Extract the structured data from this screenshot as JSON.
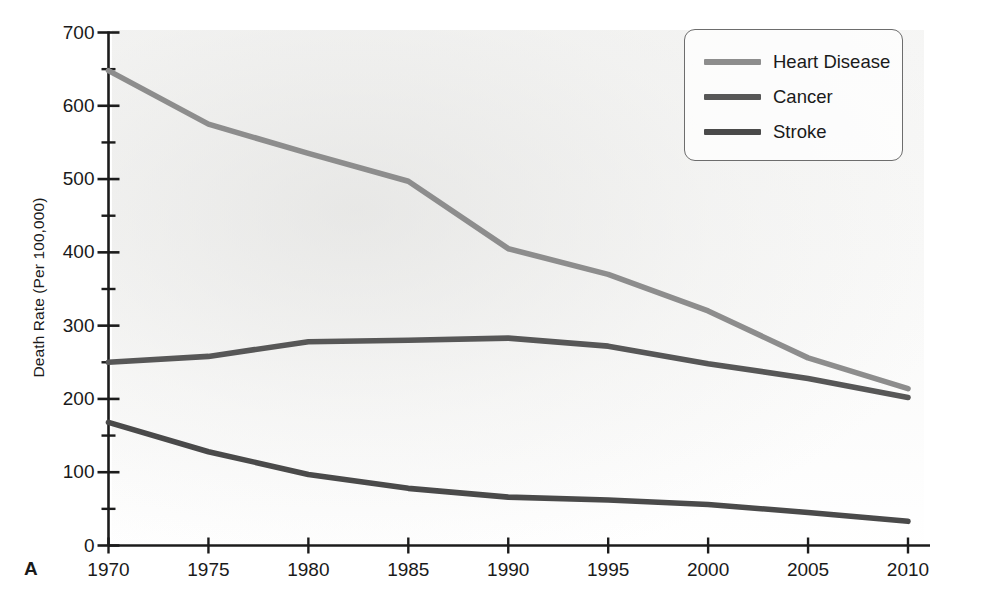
{
  "panel": {
    "letter": "A"
  },
  "legend": {
    "position": "top-right",
    "entries": [
      {
        "label": "Heart Disease",
        "color": "#8d8d8d"
      },
      {
        "label": "Cancer",
        "color": "#575757"
      },
      {
        "label": "Stroke",
        "color": "#4a4a4a"
      }
    ]
  },
  "axes": {
    "y_title": "Death Rate (Per 100,000)",
    "x_title": "",
    "y_ticks": [
      "0",
      "100",
      "200",
      "300",
      "400",
      "500",
      "600",
      "700"
    ],
    "x_ticks": [
      "1970",
      "1975",
      "1980",
      "1985",
      "1990",
      "1995",
      "2000",
      "2005",
      "2010"
    ]
  },
  "chart_data": {
    "type": "line",
    "title": "",
    "subtitle": "",
    "xlabel": "",
    "ylabel": "Death Rate (Per 100,000)",
    "x": [
      1970,
      1975,
      1980,
      1985,
      1990,
      1995,
      2000,
      2005,
      2010
    ],
    "xlim": [
      1968,
      2012
    ],
    "ylim": [
      0,
      700
    ],
    "y_major_tick_step": 100,
    "y_minor_tick_step": 50,
    "x_tick_step": 5,
    "grid": false,
    "legend_position": "top-right",
    "series": [
      {
        "name": "Heart Disease",
        "color": "#8d8d8d",
        "values": [
          648,
          575,
          535,
          497,
          405,
          370,
          320,
          256,
          214
        ]
      },
      {
        "name": "Cancer",
        "color": "#575757",
        "values": [
          250,
          258,
          278,
          280,
          283,
          272,
          248,
          228,
          202
        ]
      },
      {
        "name": "Stroke",
        "color": "#4a4a4a",
        "values": [
          168,
          128,
          97,
          78,
          66,
          62,
          56,
          45,
          33
        ]
      }
    ]
  }
}
